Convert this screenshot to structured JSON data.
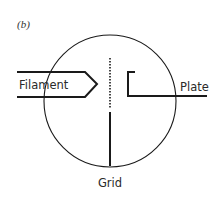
{
  "panel_label": "(b)",
  "labels": {
    "filament": "Filament",
    "plate": "Plate",
    "grid": "Grid"
  },
  "colors": {
    "stroke": "#1a1a1a",
    "background": "#ffffff",
    "text": "#2a2a2a"
  },
  "diagram": {
    "type": "triode vacuum tube schematic",
    "envelope": {
      "shape": "circle",
      "cx": 110,
      "cy": 101,
      "r": 66
    },
    "components": [
      "Filament",
      "Grid",
      "Plate"
    ]
  }
}
